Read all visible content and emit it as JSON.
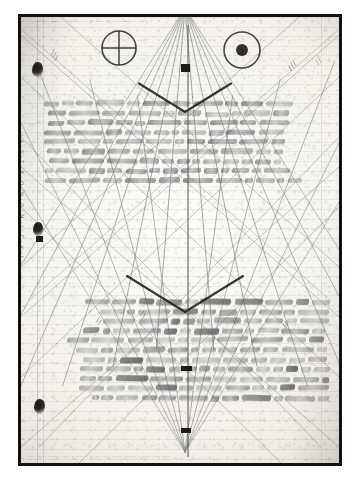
{
  "image": {
    "kind": "scanned-manuscript-photograph",
    "description": "Photograph of a ruled notebook page covered in cursive handwriting, overdrawn with straight geometric construction lines, with the lower half of the text written upside-down",
    "frame_color": "#14120f",
    "mat_color": "#ffffff",
    "paper_color": "#f3f1ea",
    "ink_color": "#40424a",
    "construction_line_color": "#5a5c66"
  },
  "symbols": [
    {
      "name": "earth-symbol",
      "glyph": "⊕",
      "label": "Earth",
      "cx": 119,
      "cy": 48,
      "r": 17
    },
    {
      "name": "sun-symbol",
      "glyph": "☉",
      "label": "Sun",
      "cx": 242,
      "cy": 50,
      "r": 18
    }
  ],
  "margins": {
    "left_caption": "· A · S · T · R · O · N · O · M · I · C · A · L ·",
    "header_strip": "··· — ···· — ······ ···· ···  ·······  ················ ····",
    "footer_strip": "···· ····· ······  ···· · ···· ·  ·····  ··· · ····· ······  ·  ···· ···· ····"
  },
  "annotations": [
    {
      "name": "ray-note-upper-left",
      "text": "╲╲╲",
      "x": 50,
      "y": 52,
      "rot": 55
    },
    {
      "name": "ray-note-upper-right",
      "text": "╱╱╱",
      "x": 287,
      "y": 62,
      "rot": -52
    },
    {
      "name": "ray-note-right-edge",
      "text": "╱╱",
      "x": 315,
      "y": 58,
      "rot": -56
    },
    {
      "name": "ray-note-mid-left",
      "text": "╲╲",
      "x": 96,
      "y": 318,
      "rot": 58
    },
    {
      "name": "ray-note-mid-center",
      "text": "╲╲",
      "x": 140,
      "y": 312,
      "rot": 58
    },
    {
      "name": "ray-note-mid-right",
      "text": "╱╱",
      "x": 232,
      "y": 318,
      "rot": -58
    },
    {
      "name": "ray-note-far-right",
      "text": "╱╱",
      "x": 282,
      "y": 322,
      "rot": -58
    }
  ],
  "ink_blots": [
    {
      "name": "ink-blot-top",
      "x": 32,
      "y": 62,
      "w": 11,
      "h": 15
    },
    {
      "name": "ink-blot-middle",
      "x": 33,
      "y": 222,
      "w": 10,
      "h": 14
    },
    {
      "name": "ink-blot-bottom",
      "x": 34,
      "y": 399,
      "w": 11,
      "h": 15
    }
  ],
  "black_marks": [
    {
      "name": "center-mark-upper",
      "x": 181,
      "y": 64,
      "w": 9,
      "h": 8
    },
    {
      "name": "center-mark-lower",
      "x": 181,
      "y": 366,
      "w": 11,
      "h": 5
    },
    {
      "name": "center-mark-bottom",
      "x": 181,
      "y": 428,
      "w": 10,
      "h": 5
    },
    {
      "name": "margin-mark-left",
      "x": 36,
      "y": 236,
      "w": 7,
      "h": 6
    }
  ],
  "text_blocks": {
    "upper": {
      "name": "upper-handwritten-paragraph",
      "orientation": "upright",
      "top": 80,
      "lines": 9,
      "note": "cursive English handwriting, largely illegible in the scan"
    },
    "lower": {
      "name": "lower-handwritten-paragraph",
      "orientation": "rotated-180",
      "top": 288,
      "lines": 11,
      "note": "second block of cursive handwriting written upside-down on the same sheet"
    }
  },
  "geometry": {
    "apex_top": {
      "x": 185,
      "y": 8
    },
    "apex_bottom": {
      "x": 185,
      "y": 452
    },
    "axis": {
      "x": 185,
      "y1": 8,
      "y2": 452
    },
    "ray_count": 34,
    "chevrons": [
      {
        "name": "chevron-upper",
        "apex_x": 185,
        "apex_y": 112,
        "span": 46
      },
      {
        "name": "chevron-lower",
        "apex_x": 185,
        "apex_y": 312,
        "span": 58
      }
    ]
  }
}
